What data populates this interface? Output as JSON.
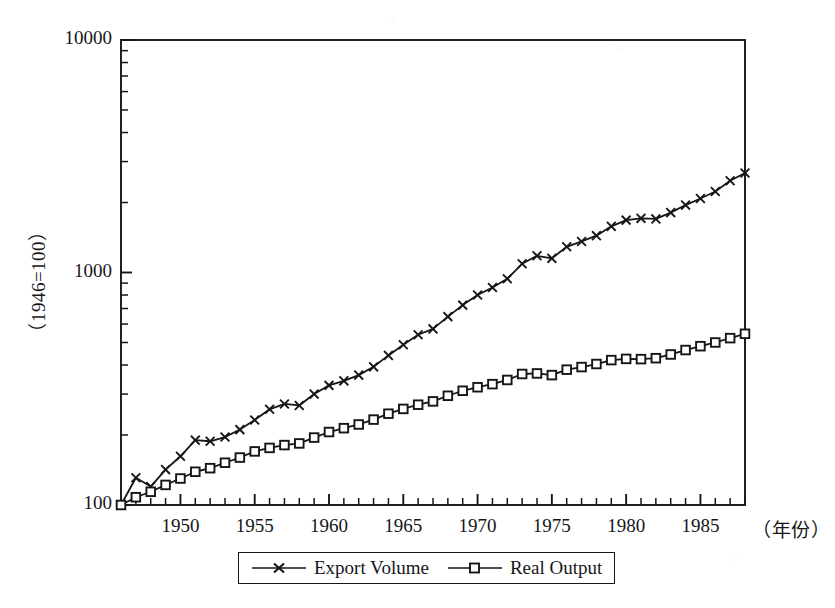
{
  "chart_data": {
    "type": "line",
    "title": "",
    "subtitle": "",
    "xlabel": "（年份）",
    "ylabel": "（1946=100）",
    "yscale": "log",
    "ylim": [
      100,
      10000
    ],
    "xlim": [
      1946,
      1988
    ],
    "grid": false,
    "legend_position": "bottom-center",
    "y_ticks_major": [
      100,
      1000,
      10000
    ],
    "y_tick_labels": [
      "100",
      "1000",
      "10000"
    ],
    "y_ticks_minor": [
      200,
      300,
      400,
      500,
      600,
      700,
      800,
      900,
      2000,
      3000,
      4000,
      5000,
      6000,
      7000,
      8000,
      9000
    ],
    "x_ticks_labeled": [
      1950,
      1955,
      1960,
      1965,
      1970,
      1975,
      1980,
      1985
    ],
    "x_tick_labels": [
      "1950",
      "1955",
      "1960",
      "1965",
      "1970",
      "1975",
      "1980",
      "1985"
    ],
    "x_tick_step_minor": 1,
    "x": [
      1946,
      1947,
      1948,
      1949,
      1950,
      1951,
      1952,
      1953,
      1954,
      1955,
      1956,
      1957,
      1958,
      1959,
      1960,
      1961,
      1962,
      1963,
      1964,
      1965,
      1966,
      1967,
      1968,
      1969,
      1970,
      1971,
      1972,
      1973,
      1974,
      1975,
      1976,
      1977,
      1978,
      1979,
      1980,
      1981,
      1982,
      1983,
      1984,
      1985,
      1986,
      1987,
      1988
    ],
    "series": [
      {
        "name": "Export Volume",
        "marker": "x",
        "color": "#16161a",
        "values": [
          100,
          131,
          120,
          142,
          162,
          190,
          188,
          196,
          211,
          232,
          258,
          272,
          268,
          300,
          327,
          342,
          362,
          393,
          440,
          489,
          540,
          572,
          646,
          724,
          800,
          862,
          940,
          1090,
          1180,
          1150,
          1290,
          1360,
          1440,
          1580,
          1680,
          1710,
          1700,
          1810,
          1950,
          2080,
          2230,
          2480,
          2680
        ]
      },
      {
        "name": "Real Output",
        "marker": "square",
        "color": "#16161a",
        "values": [
          100,
          108,
          114,
          122,
          130,
          139,
          144,
          152,
          160,
          170,
          176,
          181,
          184,
          195,
          206,
          214,
          222,
          233,
          247,
          259,
          270,
          279,
          295,
          310,
          321,
          331,
          345,
          366,
          368,
          362,
          382,
          392,
          404,
          420,
          425,
          424,
          428,
          444,
          464,
          482,
          500,
          522,
          545
        ]
      }
    ]
  },
  "legend": {
    "entries": [
      {
        "label": "Export Volume",
        "marker": "x"
      },
      {
        "label": "Real Output",
        "marker": "square"
      }
    ]
  },
  "axes": {
    "y_caption": "（1946=100）",
    "x_caption": "（年份）",
    "y_labels": [
      "10000",
      "1000",
      "100"
    ],
    "x_labels": [
      "1950",
      "1955",
      "1960",
      "1965",
      "1970",
      "1975",
      "1980",
      "1985"
    ]
  },
  "colors": {
    "ink": "#16161a",
    "paper": "#ffffff"
  }
}
